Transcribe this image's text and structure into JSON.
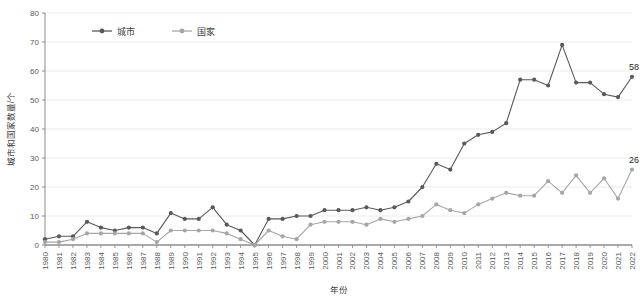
{
  "chart_data": {
    "type": "line",
    "title": "",
    "xlabel": "年份",
    "ylabel": "城市和国家数量/个",
    "xlim": [
      1980,
      2022
    ],
    "ylim": [
      0,
      80
    ],
    "ytick_step": 10,
    "yticks": [
      0,
      10,
      20,
      30,
      40,
      50,
      60,
      70,
      80
    ],
    "grid": "horizontal",
    "legend_position": "top-left-inside",
    "categories": [
      "1980",
      "1981",
      "1982",
      "1983",
      "1984",
      "1985",
      "1986",
      "1987",
      "1988",
      "1989",
      "1990",
      "1991",
      "1992",
      "1993",
      "1994",
      "1995",
      "1996",
      "1997",
      "1998",
      "1999",
      "2000",
      "2001",
      "2002",
      "2003",
      "2004",
      "2005",
      "2006",
      "2007",
      "2008",
      "2009",
      "2010",
      "2011",
      "2012",
      "2013",
      "2014",
      "2015",
      "2016",
      "2017",
      "2018",
      "2019",
      "2020",
      "2021",
      "2022"
    ],
    "series": [
      {
        "name": "城市",
        "color": "#595959",
        "marker": "circle",
        "values": [
          2,
          3,
          3,
          8,
          6,
          5,
          6,
          6,
          4,
          11,
          9,
          9,
          13,
          7,
          5,
          0,
          9,
          9,
          10,
          10,
          12,
          12,
          12,
          13,
          12,
          13,
          15,
          20,
          28,
          26,
          35,
          38,
          39,
          42,
          57,
          57,
          55,
          69,
          56,
          56,
          52,
          51,
          58
        ],
        "end_label": "58"
      },
      {
        "name": "国家",
        "color": "#a6a6a6",
        "marker": "circle",
        "values": [
          1,
          1,
          2,
          4,
          4,
          4,
          4,
          4,
          1,
          5,
          5,
          5,
          5,
          4,
          2,
          0,
          5,
          3,
          2,
          7,
          8,
          8,
          8,
          7,
          9,
          8,
          9,
          10,
          14,
          12,
          11,
          14,
          16,
          18,
          17,
          17,
          22,
          18,
          24,
          18,
          23,
          16,
          26
        ],
        "end_label": "26"
      }
    ]
  },
  "legend": {
    "items": [
      {
        "label": "城市"
      },
      {
        "label": "国家"
      }
    ]
  },
  "axis": {
    "y_title": "城市和国家数量/个",
    "x_title": "年份"
  },
  "colors": {
    "city_line": "#595959",
    "country_line": "#a6a6a6",
    "grid": "#e6e6e6",
    "axis": "#808080",
    "text": "#404040",
    "background": "#ffffff"
  }
}
